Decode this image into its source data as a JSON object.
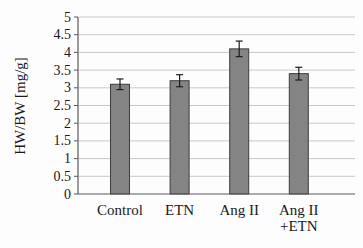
{
  "figure": {
    "background": "#fdfdfd"
  },
  "chart_data": {
    "type": "bar",
    "categories": [
      "Control",
      "ETN",
      "Ang II",
      "Ang II\n+ETN"
    ],
    "values": [
      3.1,
      3.2,
      4.1,
      3.4
    ],
    "errors": [
      0.15,
      0.17,
      0.22,
      0.18
    ],
    "title": "",
    "xlabel": "",
    "ylabel": "HW/BW [mg/g]",
    "ylim": [
      0,
      5
    ],
    "ytick_step": 0.5,
    "ytick_labels": [
      "0",
      "0.5",
      "1",
      "1.5",
      "2",
      "2.5",
      "3",
      "3.5",
      "4",
      "4.5",
      "5"
    ],
    "grid": true,
    "legend_position": "none",
    "colors": {
      "bar_fill": "#848484",
      "bar_border": "#3d3d3d",
      "error_bar": "#1c1c1c",
      "gridline": "#c9c9c9",
      "axis": "#5a5a5a",
      "text": "#1a1a1a"
    }
  }
}
